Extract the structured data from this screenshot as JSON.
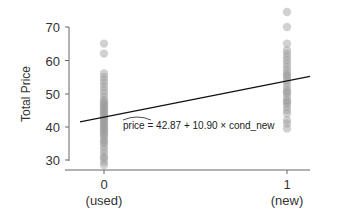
{
  "chart_data": {
    "type": "scatter",
    "title": "",
    "xlabel": "",
    "ylabel": "Total Price",
    "ylim": [
      27,
      76
    ],
    "yticks": [
      30,
      40,
      50,
      60,
      70
    ],
    "xticks": [
      0,
      1
    ],
    "xtick_labels": [
      "0",
      "1"
    ],
    "xtick_sublabels": [
      "(used)",
      "(new)"
    ],
    "grid": false,
    "series": [
      {
        "name": "used (cond_new = 0)",
        "x": 0,
        "values": [
          28.5,
          29.5,
          30.5,
          31,
          32,
          33,
          34,
          35,
          35.5,
          36,
          37,
          37.5,
          38,
          38.5,
          39,
          39.5,
          40,
          40.5,
          41,
          41.5,
          42,
          42.5,
          43,
          43.5,
          44,
          44.5,
          45,
          45.5,
          46,
          46.5,
          47,
          47.5,
          48,
          49,
          50,
          51,
          52,
          53,
          54,
          55,
          56,
          62,
          65
        ]
      },
      {
        "name": "new (cond_new = 1)",
        "x": 1,
        "values": [
          39.5,
          41,
          42,
          44,
          45,
          46,
          47,
          47.5,
          48,
          49,
          50,
          50.5,
          51,
          52,
          53,
          54,
          55,
          55.5,
          56,
          57,
          58,
          59,
          60,
          61,
          62,
          63,
          65,
          70,
          74.5
        ]
      }
    ],
    "regression": {
      "intercept": 42.87,
      "slope": 10.9,
      "equation_label": "price = 42.87 + 10.90 × cond_new",
      "hat_variable": "price"
    }
  },
  "labels": {
    "ylabel": "Total Price",
    "yticks": [
      "30",
      "40",
      "50",
      "60",
      "70"
    ],
    "x0": "0",
    "x0_sub": "(used)",
    "x1": "1",
    "x1_sub": "(new)",
    "equation_hat": "price",
    "equation_rest": " = 42.87 + 10.90 × cond_new"
  },
  "colors": {
    "points": "#9a9a9a",
    "line": "#111111",
    "axis": "#555555"
  }
}
